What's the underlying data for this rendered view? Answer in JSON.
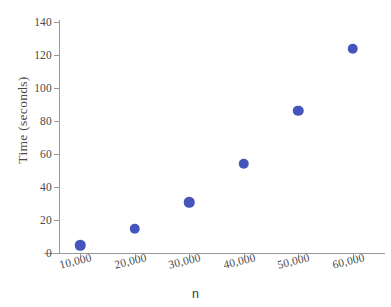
{
  "chart_data": {
    "type": "scatter",
    "title": "",
    "xlabel": "n",
    "ylabel": "Time (seconds)",
    "x": [
      10000,
      20000,
      30000,
      40000,
      50000,
      60000
    ],
    "values": [
      4.5,
      14.5,
      30.5,
      54,
      86,
      123.5
    ],
    "series": [
      {
        "name": "Time",
        "values": [
          4.5,
          14.5,
          30.5,
          54,
          86,
          123.5
        ]
      }
    ],
    "categories": [
      "10,000",
      "20,000",
      "30,000",
      "40,000",
      "50,000",
      "60,000"
    ],
    "xtick_labels": [
      "10,000",
      "20,000",
      "30,000",
      "40,000",
      "50,000",
      "60,000"
    ],
    "ytick_labels": [
      "0",
      "20",
      "40",
      "60",
      "80",
      "100",
      "120",
      "140"
    ],
    "yticks": [
      0,
      20,
      40,
      60,
      80,
      100,
      120,
      140
    ],
    "ylim": [
      0,
      140
    ],
    "xlim": [
      5000,
      65000
    ],
    "grid": false,
    "legend": false,
    "marker_color": "#4455bb",
    "axis_color": "#9a9a9a",
    "text_color": "#4a4a4a"
  }
}
